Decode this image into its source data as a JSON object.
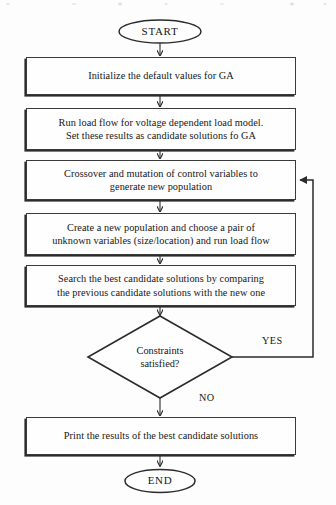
{
  "diagram": {
    "type": "flowchart",
    "terminals": {
      "start": "START",
      "end": "END"
    },
    "process_steps": [
      {
        "id": "init",
        "lines": [
          "Initialize the default values for GA"
        ]
      },
      {
        "id": "load-flow",
        "lines": [
          "Run load flow for voltage dependent load model.",
          "Set these results as candidate solutions fo GA"
        ]
      },
      {
        "id": "crossover",
        "lines": [
          "Crossover and mutation of control variables to",
          "generate new population"
        ]
      },
      {
        "id": "new-population",
        "lines": [
          "Create  a new  population and choose a pair of",
          "unknown variables (size/location) and run load flow"
        ]
      },
      {
        "id": "search-best",
        "lines": [
          "Search the best candidate solutions by comparing",
          "the previous candidate solutions with the new one"
        ]
      },
      {
        "id": "print-results",
        "lines": [
          "Print the results of the best candidate solutions"
        ]
      }
    ],
    "decision": {
      "id": "constraints",
      "lines": [
        "Constraints",
        "satisfied?"
      ]
    },
    "branch_labels": {
      "yes": "YES",
      "no": "NO"
    },
    "colors": {
      "stroke": "#2b2b2b",
      "text": "#16161a",
      "background": "#fdfdfd"
    }
  }
}
